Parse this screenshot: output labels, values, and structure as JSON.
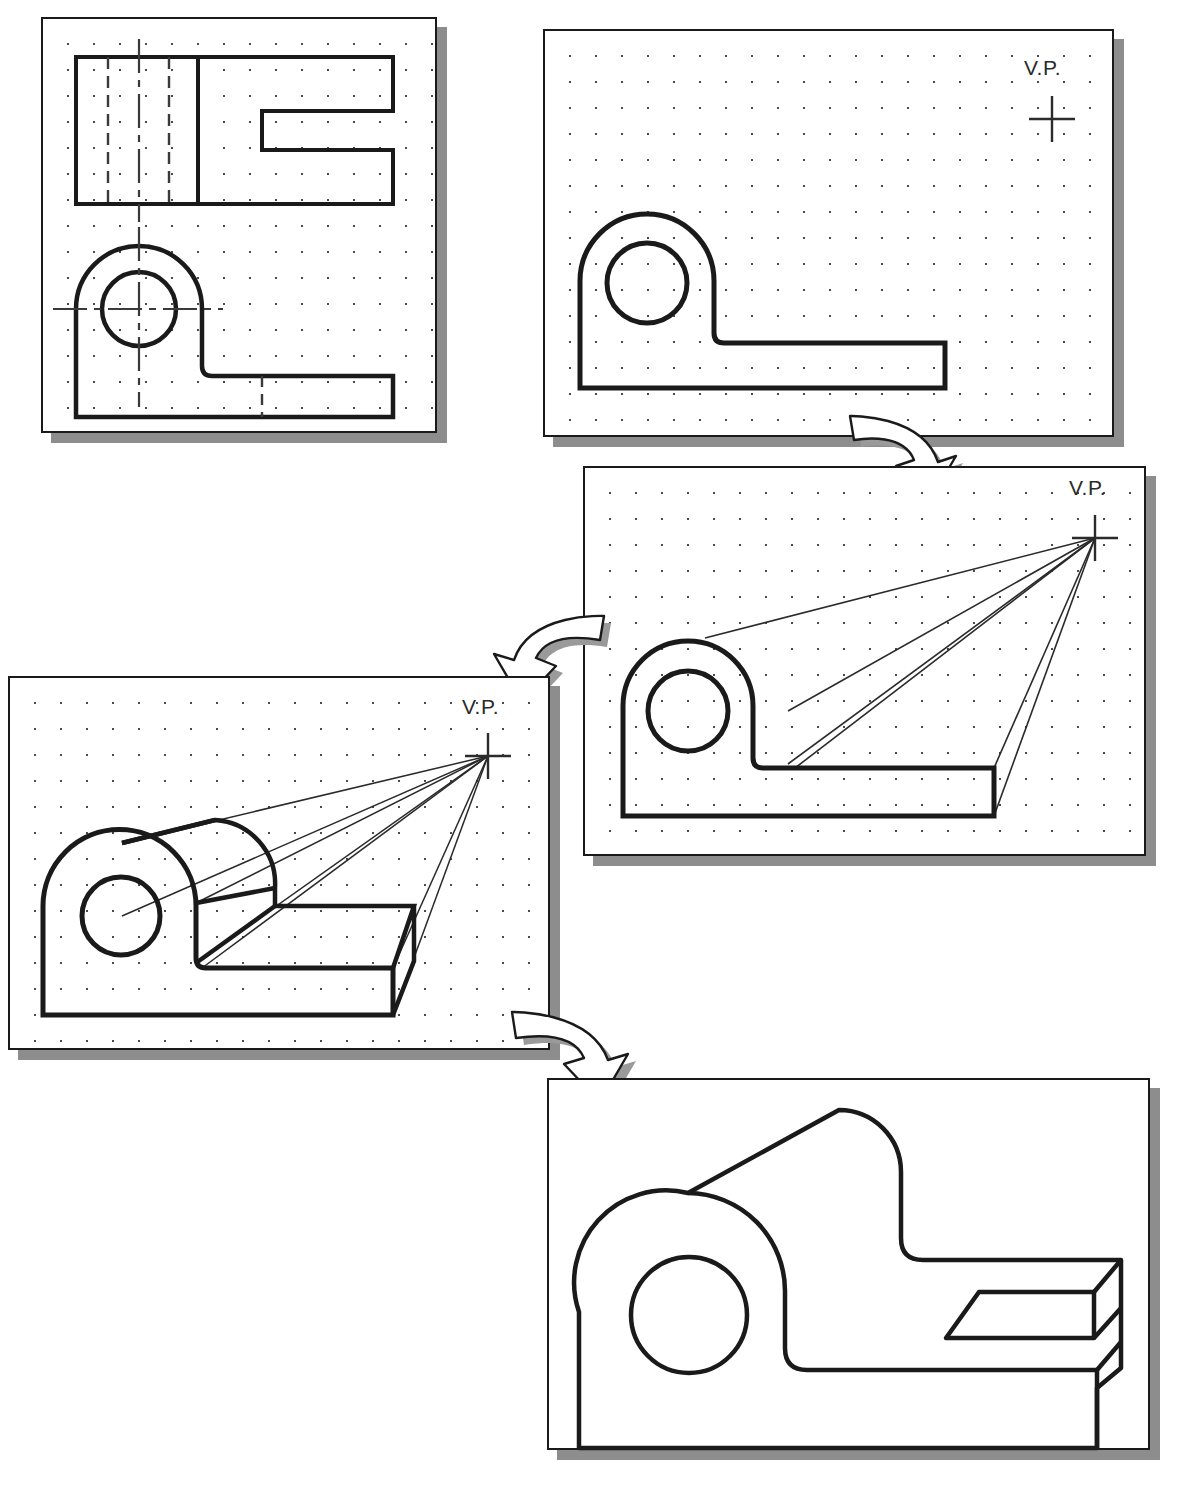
{
  "figure": {
    "panel_count": 5,
    "arrow_count": 3,
    "vanishing_point_label": "V.P."
  },
  "panels": [
    {
      "id": "panel-orthographic-views",
      "step": 1,
      "name": "Orthographic views (top view and front view)",
      "x": 41,
      "y": 17,
      "w": 396,
      "h": 416,
      "grid": true,
      "has_vp": false,
      "vp_label": "",
      "contents": [
        "top-view-rectangle-with-notch",
        "hidden-dashed-lines",
        "center-lines",
        "front-view-profile",
        "circular-hole"
      ]
    },
    {
      "id": "panel-front-profile",
      "step": 2,
      "name": "Front profile traced with vanishing point marked",
      "x": 543,
      "y": 29,
      "w": 571,
      "h": 408,
      "grid": true,
      "has_vp": true,
      "vp_label": "V.P.",
      "contents": [
        "front-view-profile",
        "circular-hole",
        "vanishing-point-cross"
      ]
    },
    {
      "id": "panel-projection-lines",
      "step": 3,
      "name": "Projection lines drawn from corners to vanishing point",
      "x": 583,
      "y": 466,
      "w": 563,
      "h": 390,
      "grid": true,
      "has_vp": true,
      "vp_label": "V.P.",
      "contents": [
        "front-view-profile",
        "circular-hole",
        "vanishing-point-cross",
        "convergence-rays",
        "depth-edge"
      ]
    },
    {
      "id": "panel-depth-blocked",
      "step": 4,
      "name": "Depth blocked in along the projection lines",
      "x": 8,
      "y": 676,
      "w": 542,
      "h": 374,
      "grid": true,
      "has_vp": true,
      "vp_label": "V.P.",
      "contents": [
        "front-view-profile",
        "circular-hole",
        "vanishing-point-cross",
        "convergence-rays",
        "receding-top-surface",
        "receding-base-block"
      ]
    },
    {
      "id": "panel-final-pictorial",
      "step": 5,
      "name": "Finished one-point perspective pictorial, construction lines removed",
      "x": 547,
      "y": 1078,
      "w": 603,
      "h": 372,
      "grid": false,
      "has_vp": false,
      "vp_label": "",
      "contents": [
        "finished-solid-outline",
        "circular-hole",
        "receding-top-surface",
        "notch-detail",
        "base-block"
      ]
    }
  ],
  "arrows": [
    {
      "id": "arrow-step1-to-step2",
      "name": "curved-arrow-down-right",
      "x": 826,
      "y": 396,
      "w": 140,
      "h": 110,
      "direction": "down-right"
    },
    {
      "id": "arrow-step2-to-step3",
      "name": "curved-arrow-down-left",
      "x": 476,
      "y": 596,
      "w": 146,
      "h": 112,
      "direction": "down-left"
    },
    {
      "id": "arrow-step3-to-step4",
      "name": "curved-arrow-down-right",
      "x": 490,
      "y": 990,
      "w": 152,
      "h": 118,
      "direction": "down-right"
    }
  ],
  "colors": {
    "ink": "#1a1a1a",
    "grid_dot": "#4a4a52",
    "shadow": "#8d8d8d",
    "paper": "#ffffff",
    "thin_line": "#2a2a2a"
  }
}
